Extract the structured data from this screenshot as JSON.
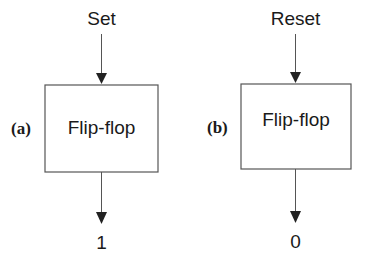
{
  "diagram": {
    "panels": [
      {
        "id": "a",
        "label": "(a)",
        "input_label": "Set",
        "box_label": "Flip-flop",
        "output_label": "1"
      },
      {
        "id": "b",
        "label": "(b)",
        "input_label": "Reset",
        "box_label": "Flip-flop",
        "output_label": "0"
      }
    ],
    "colors": {
      "line": "#444444",
      "text": "#1a1a1a",
      "background": "#ffffff"
    }
  }
}
